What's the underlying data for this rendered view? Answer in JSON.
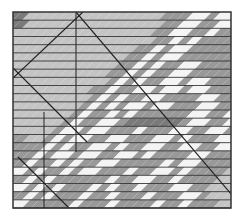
{
  "palette": {
    "L": "#c4c4c4",
    "M": "#999999",
    "D": "#7a7a7a",
    "W": "#f4f4f4",
    "line": "#222222",
    "border": "#333333"
  },
  "rows": [
    "DLLLLLLLLLLLLLLLMMMWWMWW",
    "DLLLLLLLLLLLLLLLMMWWMMWW",
    "LLLLLLLLLLLLLLLMMWWMMWMM",
    "LLLLLLLLLLLLLLLMMWMWMMMM",
    "LLLLLLLLLLLLLMMWMWWMMMMM",
    "LLLLLLLLLLLLMMWMWWMMMMMM",
    "LLLLLLLLLLLMMWMWMMWWMMMM",
    "LLLLLLLLLLMMWMWMMWWMMMMM",
    "LLLLLLLLLLMWMWMMWWMWWMMM",
    "LLLLLLLLMMWMMWWMWWMWWMMM",
    "LLLLLLLLMWMWMMWWMMMMWWMM",
    "LLLLLLLMWMWMWWMWWMMMWWMM",
    "LLLLLLMWMMWMWMMMMMMWWMMW",
    "LLLLLMWMMWWMDDDDDDMWWMMW",
    "LLLLMWWMWWMMMWMMMWWMMWWM",
    "MLLMWMWWMMWWMMMWWMWMMMWW",
    "MMMWMWMMWWMWMMWWMMWWMMWW",
    "MMWMWWMWWMMWWMWMMMMWWMMM",
    "MWMMWMWMMWWMMMMMWMWWMMMM",
    "WMWMMWMWWMMMWMMWWMWMMMML",
    "MWMWMMMMMMWMMWWMMWMMMMLL",
    "WMWMWMMMWMWMMWMMMWWMMLLL",
    "MWMWMMMWMMWMMMWMMMWWMLLL",
    "WMMMMMWMMMWMMMMWMMWMMMLL"
  ]
}
